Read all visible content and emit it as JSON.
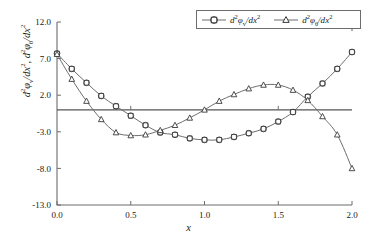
{
  "chart_data": {
    "type": "line",
    "title": "",
    "xlabel": "x",
    "ylabel": "d²φᵥ/dx², d²φθ/dx²",
    "xlim": [
      0.0,
      2.0
    ],
    "ylim": [
      -13.0,
      12.0
    ],
    "xticks": [
      "0.0",
      "0.5",
      "1.0",
      "1.5",
      "2.0"
    ],
    "xtick_values": [
      0.0,
      0.5,
      1.0,
      1.5,
      2.0
    ],
    "yticks": [
      "12.0",
      "7.0",
      "2.0",
      "-3.0",
      "-8.0",
      "-13.0"
    ],
    "ytick_values": [
      12.0,
      7.0,
      2.0,
      -3.0,
      -8.0,
      -13.0
    ],
    "grid": false,
    "zero_line": true,
    "legend_position": "top-right",
    "x": [
      0.0,
      0.1,
      0.2,
      0.3,
      0.4,
      0.5,
      0.6,
      0.7,
      0.8,
      0.9,
      1.0,
      1.1,
      1.2,
      1.3,
      1.4,
      1.5,
      1.6,
      1.7,
      1.8,
      1.9,
      2.0
    ],
    "series": [
      {
        "name": "d²φᵥ/dx²",
        "marker": "circle",
        "color": "#4a4a4a",
        "values": [
          7.7,
          5.6,
          3.7,
          1.9,
          0.5,
          -0.8,
          -2.1,
          -3.1,
          -3.4,
          -3.9,
          -4.1,
          -4.1,
          -3.7,
          -3.2,
          -2.6,
          -1.6,
          -0.3,
          1.8,
          3.6,
          5.6,
          7.9
        ]
      },
      {
        "name": "d²φθ/dx²",
        "marker": "triangle",
        "color": "#4a4a4a",
        "values": [
          7.6,
          4.2,
          1.2,
          -1.3,
          -3.1,
          -3.5,
          -3.4,
          -2.8,
          -2.1,
          -1.1,
          0.0,
          1.2,
          2.1,
          2.9,
          3.4,
          3.4,
          2.7,
          1.3,
          -0.9,
          -3.4,
          -8.0
        ]
      }
    ]
  },
  "legend": {
    "entries": [
      {
        "marker": "circle",
        "prefix": "d",
        "sup1": "2",
        "phi": "φ",
        "sub": "ᵥ",
        "slash": "/d",
        "var": "x",
        "sup2": "2"
      },
      {
        "marker": "triangle",
        "prefix": "d",
        "sup1": "2",
        "phi": "φ",
        "sub": "θ",
        "slash": "/d",
        "var": "x",
        "sup2": "2"
      }
    ]
  },
  "axis": {
    "x_label": "x",
    "y_label_part1_d": "d",
    "y_label_sup": "2",
    "y_label_phi": "φ",
    "y_label_sub_v": "ᵥ",
    "y_label_sub_t": "θ",
    "y_label_slash": "/d",
    "y_label_x": "x"
  },
  "colors": {
    "axis": "#6d6d6d",
    "line": "#6d6d6d",
    "marker_stroke": "#3a3a3a",
    "marker_fill": "#ffffff",
    "zero_line": "#555555",
    "background": "#ffffff",
    "text": "#1a1a1a"
  }
}
